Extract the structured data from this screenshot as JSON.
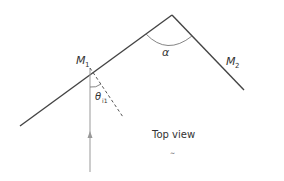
{
  "diagram": {
    "labels": {
      "mirror1": "M",
      "mirror1_sub": "1",
      "mirror2": "M",
      "mirror2_sub": "2",
      "angle_between": "α",
      "incident_angle": "θ",
      "incident_angle_sub": "i1",
      "caption": "Top view",
      "caption_mark": "~"
    },
    "colors": {
      "mirror": "#444444",
      "ray": "#999999",
      "normal": "#555555",
      "arc": "#777777"
    }
  }
}
